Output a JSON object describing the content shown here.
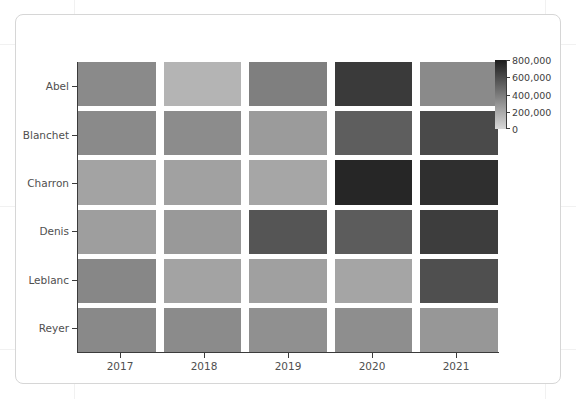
{
  "figure": {
    "background_color": "#ffffff",
    "border_color": "#d6d6d6",
    "axis_color": "#3b3b3b",
    "tick_label_color": "#4f4f4f"
  },
  "chart_data": {
    "type": "heatmap",
    "title": "",
    "xlabel": "",
    "ylabel": "",
    "categories": [
      "2017",
      "2018",
      "2019",
      "2020",
      "2021"
    ],
    "x": [
      "2017",
      "2018",
      "2019",
      "2020",
      "2021"
    ],
    "y": [
      "Abel",
      "Blanchet",
      "Charron",
      "Denis",
      "Leblanc",
      "Reyer"
    ],
    "xtick_labels": [
      "2017",
      "2018",
      "2019",
      "2020",
      "2021"
    ],
    "ytick_labels": [
      "Abel",
      "Blanchet",
      "Charron",
      "Denis",
      "Leblanc",
      "Reyer"
    ],
    "grid": false,
    "legend_position": "right",
    "colorbar": {
      "orientation": "vertical",
      "position": "right",
      "vmin": 0,
      "vmax": 800000,
      "ticks": [
        800000,
        600000,
        400000,
        200000,
        0
      ],
      "tick_labels": [
        "800,000",
        "600,000",
        "400,000",
        "200,000",
        "0"
      ],
      "colormap": "greys_reversed",
      "low_color": "#d8d8d8",
      "high_color": "#1c1c1c"
    },
    "series": [
      {
        "name": "Abel",
        "values": [
          430000,
          210000,
          500000,
          760000,
          430000
        ]
      },
      {
        "name": "Blanchet",
        "values": [
          430000,
          420000,
          340000,
          590000,
          690000
        ]
      },
      {
        "name": "Charron",
        "values": [
          300000,
          310000,
          290000,
          810000,
          760000
        ]
      },
      {
        "name": "Denis",
        "values": [
          330000,
          360000,
          620000,
          590000,
          740000
        ]
      },
      {
        "name": "Leblanc",
        "values": [
          460000,
          300000,
          310000,
          280000,
          640000
        ]
      },
      {
        "name": "Reyer",
        "values": [
          450000,
          440000,
          400000,
          420000,
          370000
        ]
      }
    ],
    "cell_colors": [
      [
        "#8a8a8a",
        "#b4b4b4",
        "#7f7f7f",
        "#3a3a3a",
        "#8a8a8a"
      ],
      [
        "#8a8a8a",
        "#8c8c8c",
        "#9b9b9b",
        "#5e5e5e",
        "#4a4a4a"
      ],
      [
        "#a3a3a3",
        "#a1a1a1",
        "#a6a6a6",
        "#262626",
        "#2f2f2f"
      ],
      [
        "#9e9e9e",
        "#999999",
        "#555555",
        "#5c5c5c",
        "#3d3d3d"
      ],
      [
        "#878787",
        "#a3a3a3",
        "#a0a0a0",
        "#a5a5a5",
        "#4f4f4f"
      ],
      [
        "#898989",
        "#8b8b8b",
        "#909090",
        "#8e8e8e",
        "#979797"
      ]
    ]
  }
}
